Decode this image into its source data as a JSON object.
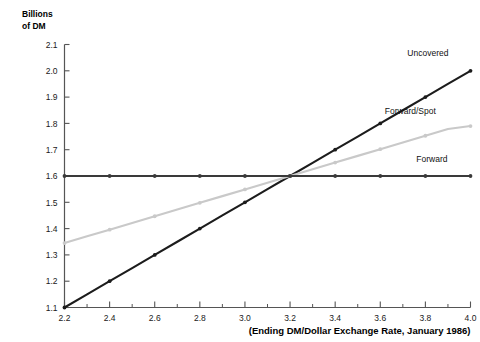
{
  "chart_data": {
    "type": "line",
    "title": "",
    "subtitle": "",
    "ylabel_line1": "Billions",
    "ylabel_line2": "of DM",
    "xlabel": "(Ending DM/Dollar Exchange Rate, January 1986)",
    "xlim": [
      2.2,
      4.0
    ],
    "ylim": [
      1.1,
      2.1
    ],
    "grid": false,
    "legend_position": "right-inline",
    "x_ticks": [
      "2.2",
      "2.4",
      "2.6",
      "2.8",
      "3.0",
      "3.2",
      "3.4",
      "3.6",
      "3.8",
      "4.0"
    ],
    "x_tick_values": [
      2.2,
      2.4,
      2.6,
      2.8,
      3.0,
      3.2,
      3.4,
      3.6,
      3.8,
      4.0
    ],
    "x_minor_tick_values": [
      2.3,
      2.5,
      2.7,
      2.9,
      3.1,
      3.3,
      3.5,
      3.7,
      3.9
    ],
    "y_ticks": [
      "2.1",
      "2.0",
      "1.9",
      "1.8",
      "1.7",
      "1.6",
      "1.5",
      "1.4",
      "1.3",
      "1.2",
      "1.1"
    ],
    "y_tick_values": [
      2.1,
      2.0,
      1.9,
      1.8,
      1.7,
      1.6,
      1.5,
      1.4,
      1.3,
      1.2,
      1.1
    ],
    "x": [
      2.2,
      2.3,
      2.4,
      2.5,
      2.6,
      2.7,
      2.8,
      2.9,
      3.0,
      3.1,
      3.2,
      3.3,
      3.4,
      3.5,
      3.6,
      3.7,
      3.8,
      3.9,
      4.0
    ],
    "series": [
      {
        "name": "Uncovered",
        "color": "#1c1c1c",
        "label_x": 3.72,
        "label_y": 2.055,
        "values": [
          1.1,
          1.15,
          1.2,
          1.25,
          1.3,
          1.35,
          1.4,
          1.45,
          1.5,
          1.55,
          1.6,
          1.65,
          1.7,
          1.75,
          1.8,
          1.85,
          1.9,
          1.95,
          2.0
        ]
      },
      {
        "name": "Forward/Spot",
        "color": "#c9c9c9",
        "label_x": 3.62,
        "label_y": 1.835,
        "values": [
          1.345,
          1.3705,
          1.396,
          1.4215,
          1.447,
          1.4725,
          1.498,
          1.5235,
          1.549,
          1.5745,
          1.6,
          1.6255,
          1.651,
          1.6765,
          1.702,
          1.7275,
          1.753,
          1.7785,
          1.79
        ]
      },
      {
        "name": "Forward",
        "color": "#3a3a3a",
        "label_x": 3.76,
        "label_y": 1.655,
        "values": [
          1.6,
          1.6,
          1.6,
          1.6,
          1.6,
          1.6,
          1.6,
          1.6,
          1.6,
          1.6,
          1.6,
          1.6,
          1.6,
          1.6,
          1.6,
          1.6,
          1.6,
          1.6,
          1.6
        ]
      }
    ],
    "intersection": {
      "x": 3.2,
      "y": 1.6
    },
    "axis_color": "#555555"
  }
}
